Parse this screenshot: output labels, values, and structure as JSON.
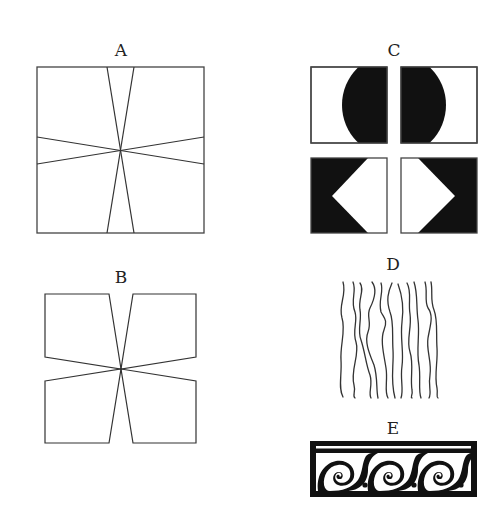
{
  "figure": {
    "panels": [
      {
        "id": "A",
        "label": "A",
        "description": "Square divided by four lines crossing at the center"
      },
      {
        "id": "B",
        "label": "B",
        "description": "Four quadrilateral pieces meeting at a single center point"
      },
      {
        "id": "C",
        "label": "C",
        "description": "Four rectangles: top pair with black half-circles, bottom pair black with white half-diamonds"
      },
      {
        "id": "D",
        "label": "D",
        "description": "Parallel wavy vertical lines"
      },
      {
        "id": "E",
        "label": "E",
        "description": "Black framed band with running spiral scroll motif and dots"
      }
    ],
    "colors": {
      "ink": "#111111",
      "line": "#333333",
      "paper": "#ffffff"
    },
    "wavy_line_count": 11,
    "scroll_spiral_count": 3
  }
}
